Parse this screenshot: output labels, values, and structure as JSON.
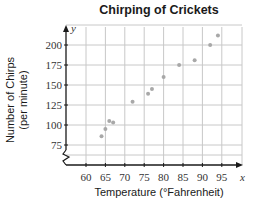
{
  "chart_data": {
    "type": "scatter",
    "title": "Chirping of Crickets",
    "xlabel": "Temperature (°Fahrenheit)",
    "ylabel_line1": "Number of Chirps",
    "ylabel_line2": "(per minute)",
    "x_axis_symbol": "x",
    "y_axis_symbol": "y",
    "xlim": [
      55,
      100
    ],
    "ylim": [
      50,
      225
    ],
    "x_ticks": [
      60,
      65,
      70,
      75,
      80,
      85,
      90,
      95
    ],
    "y_ticks": [
      75,
      100,
      125,
      150,
      175,
      200
    ],
    "grid": true,
    "axis_break": "y-axis break near origin (zigzag)",
    "points": [
      {
        "x": 64,
        "y": 86
      },
      {
        "x": 65,
        "y": 95
      },
      {
        "x": 66,
        "y": 105
      },
      {
        "x": 67,
        "y": 103
      },
      {
        "x": 72,
        "y": 129
      },
      {
        "x": 76,
        "y": 139
      },
      {
        "x": 77,
        "y": 145
      },
      {
        "x": 80,
        "y": 160
      },
      {
        "x": 84,
        "y": 175
      },
      {
        "x": 88,
        "y": 181
      },
      {
        "x": 92,
        "y": 200
      },
      {
        "x": 94,
        "y": 212
      }
    ],
    "colors": {
      "grid": "#c8c8c8",
      "axis": "#1a1a1a",
      "point": "#a8a8a8"
    }
  }
}
